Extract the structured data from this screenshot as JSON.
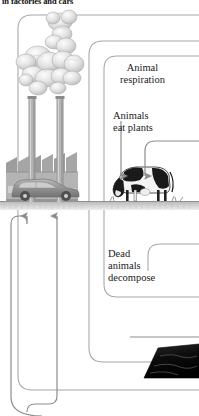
{
  "diagram": {
    "caption_top": "in factories and cars",
    "labels": {
      "animal_respiration": "Animal\nrespiration",
      "animals_eat_plants": "Animals\neat plants",
      "dead_animals_decompose": "Dead\nanimals\ndecompose"
    },
    "elements": {
      "factory": "factory-building",
      "car": "car",
      "smokestack_left": "smokestack",
      "smokestack_right": "smokestack",
      "smoke_plume": "smoke-cloud",
      "cow": "grazing-cow",
      "ground": "ground-line",
      "coal_seam": "coal-deposit"
    },
    "colors": {
      "background": "#ffffff",
      "flow_line": "#8d8d8d",
      "text": "#1b1b1b",
      "ground": "#9a9a9a",
      "factory": "#a8a8a8",
      "smoke": "#c9c9c9",
      "coal": "#121212",
      "cow_dark": "#1a1a1a",
      "cow_light": "#f2f2f2"
    },
    "flows": [
      {
        "name": "factory-emissions-arrow-left",
        "direction": "up"
      },
      {
        "name": "factory-emissions-arrow-right",
        "direction": "up"
      },
      {
        "name": "animals-eat-plants-arrow",
        "direction": "down"
      }
    ]
  }
}
